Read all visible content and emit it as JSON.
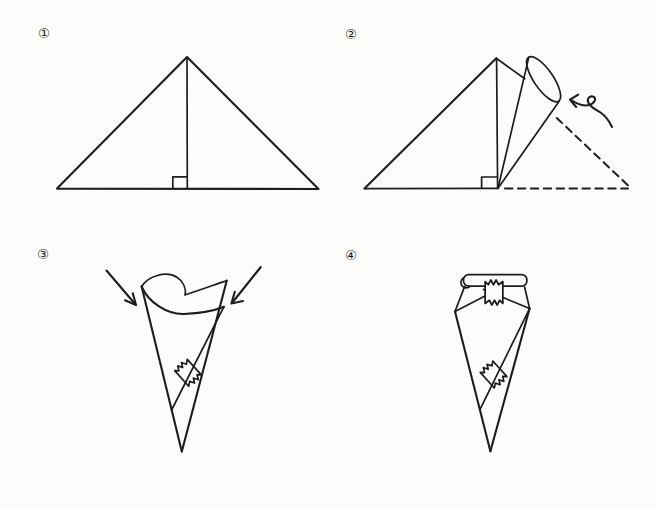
{
  "figure": {
    "kind": "origami-instruction-diagram",
    "background_color": "#fcfcfa",
    "ink_color": "#1d1d1b",
    "steps": [
      {
        "label": "①",
        "name": "triangle-with-center-crease"
      },
      {
        "label": "②",
        "name": "roll-corner-into-cone",
        "annotations": [
          "curl-roll-arrow",
          "dashed-previous-position",
          "right-angle-mark"
        ]
      },
      {
        "label": "③",
        "name": "wrap-cone-press-corners",
        "annotations": [
          "press-arrow-left",
          "press-arrow-right",
          "tape-seal-on-seam"
        ]
      },
      {
        "label": "④",
        "name": "finished-cone-top-folded",
        "annotations": [
          "rolled-top-edge",
          "tape-seal-top",
          "tape-seal-on-seam"
        ]
      }
    ]
  }
}
